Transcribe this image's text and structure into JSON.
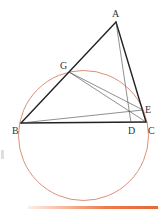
{
  "figure": {
    "title": "",
    "points": {
      "A": {
        "label": "A",
        "x": 116,
        "y": 22
      },
      "B": {
        "label": "B",
        "x": 21,
        "y": 123
      },
      "C": {
        "label": "C",
        "x": 146,
        "y": 122
      },
      "D": {
        "label": "D",
        "x": 131,
        "y": 123
      },
      "E": {
        "label": "E",
        "x": 143,
        "y": 110
      },
      "G": {
        "label": "G",
        "x": 69,
        "y": 72
      }
    },
    "circle": {
      "cx": 83.5,
      "cy": 135.5,
      "r": 65,
      "color": "#d8826a"
    },
    "segments_thick": [
      "AB",
      "AC",
      "BC"
    ],
    "segments_thin": [
      "AD",
      "BE",
      "GE",
      "GC"
    ],
    "accent_bar_color": "#ee7b4a"
  }
}
